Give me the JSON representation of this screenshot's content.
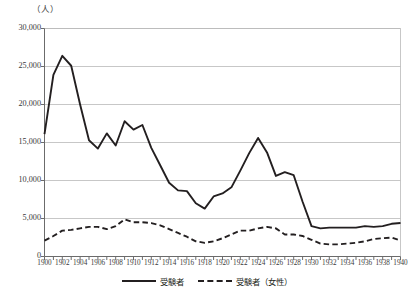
{
  "chart_data": {
    "type": "line",
    "title": "",
    "xlabel": "",
    "ylabel": "（人）",
    "ylim": [
      0,
      30000
    ],
    "xlim": [
      1900,
      1940
    ],
    "grid": true,
    "legend_position": "bottom-center",
    "ytick_labels": [
      "30,000",
      "25,000",
      "20,000",
      "15,000",
      "10,000",
      "5,000",
      "0"
    ],
    "ytick_values": [
      30000,
      25000,
      20000,
      15000,
      10000,
      5000,
      0
    ],
    "xtick_labels": [
      "1900",
      "1902",
      "1904",
      "1906",
      "1908",
      "1910",
      "1912",
      "1914",
      "1916",
      "1918",
      "1920",
      "1922",
      "1924",
      "1926",
      "1928",
      "1930",
      "1932",
      "1934",
      "1936",
      "1938",
      "1940"
    ],
    "x": [
      1900,
      1901,
      1902,
      1903,
      1904,
      1905,
      1906,
      1907,
      1908,
      1909,
      1910,
      1911,
      1912,
      1913,
      1914,
      1915,
      1916,
      1917,
      1918,
      1919,
      1920,
      1921,
      1922,
      1923,
      1924,
      1925,
      1926,
      1927,
      1928,
      1929,
      1930,
      1931,
      1932,
      1933,
      1934,
      1935,
      1936,
      1937,
      1938,
      1939,
      1940
    ],
    "series": [
      {
        "name": "受験者",
        "style": "solid",
        "color": "#231f20",
        "values": [
          16100,
          23900,
          26400,
          25100,
          20000,
          15300,
          14200,
          16200,
          14600,
          17800,
          16700,
          17300,
          14300,
          12000,
          9700,
          8700,
          8600,
          7000,
          6300,
          7900,
          8300,
          9100,
          11300,
          13600,
          15600,
          13700,
          10600,
          11100,
          10700,
          7200,
          4000,
          3700,
          3800,
          3800,
          3800,
          3800,
          4000,
          3900,
          4000,
          4300,
          4400
        ]
      },
      {
        "name": "受験者（女性）",
        "style": "dashed",
        "color": "#231f20",
        "values": [
          2100,
          2700,
          3400,
          3500,
          3700,
          3900,
          3900,
          3600,
          4000,
          4900,
          4500,
          4500,
          4400,
          4100,
          3600,
          3100,
          2600,
          2000,
          1800,
          2000,
          2400,
          2900,
          3400,
          3400,
          3700,
          3900,
          3700,
          2900,
          2900,
          2700,
          2200,
          1700,
          1600,
          1600,
          1700,
          1800,
          2000,
          2300,
          2400,
          2500,
          2100
        ]
      }
    ]
  },
  "legend": {
    "items": [
      {
        "label": "受験者",
        "style": "solid"
      },
      {
        "label": "受験者（女性）",
        "style": "dashed"
      }
    ]
  }
}
